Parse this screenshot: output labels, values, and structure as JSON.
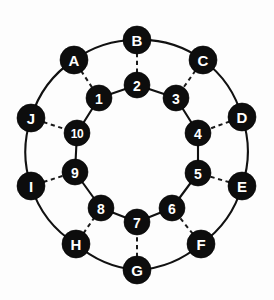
{
  "diagram": {
    "background_color": "#fdfdfd",
    "node_fill_color": "#0d0d0d",
    "node_label_color": "#ffffff",
    "edge_color": "#111111",
    "spoke_style": "dashed",
    "ring_style": "solid",
    "canvas": {
      "width": 274,
      "height": 300
    }
  },
  "outer_ring": {
    "name": "outer-cycle",
    "radius": 106,
    "center": {
      "x": 137,
      "y": 152
    },
    "node_radius": 14,
    "nodes": [
      {
        "id": "A",
        "label": "A",
        "x": 74,
        "y": 60
      },
      {
        "id": "B",
        "label": "B",
        "x": 137,
        "y": 40
      },
      {
        "id": "C",
        "label": "C",
        "x": 203,
        "y": 60
      },
      {
        "id": "D",
        "label": "D",
        "x": 242,
        "y": 117
      },
      {
        "id": "E",
        "label": "E",
        "x": 242,
        "y": 186
      },
      {
        "id": "F",
        "label": "F",
        "x": 201,
        "y": 244
      },
      {
        "id": "G",
        "label": "G",
        "x": 137,
        "y": 270
      },
      {
        "id": "H",
        "label": "H",
        "x": 76,
        "y": 244
      },
      {
        "id": "I",
        "label": "I",
        "x": 31,
        "y": 186
      },
      {
        "id": "J",
        "label": "J",
        "x": 31,
        "y": 118
      }
    ],
    "edges": [
      [
        "A",
        "B"
      ],
      [
        "B",
        "C"
      ],
      [
        "C",
        "D"
      ],
      [
        "D",
        "E"
      ],
      [
        "E",
        "F"
      ],
      [
        "F",
        "G"
      ],
      [
        "G",
        "H"
      ],
      [
        "H",
        "I"
      ],
      [
        "I",
        "J"
      ],
      [
        "J",
        "A"
      ]
    ]
  },
  "inner_ring": {
    "name": "inner-cycle",
    "radius": 63,
    "center": {
      "x": 137,
      "y": 152
    },
    "node_radius": 13,
    "nodes": [
      {
        "id": "1",
        "label": "1",
        "x": 99,
        "y": 98
      },
      {
        "id": "2",
        "label": "2",
        "x": 137,
        "y": 85
      },
      {
        "id": "3",
        "label": "3",
        "x": 176,
        "y": 98
      },
      {
        "id": "4",
        "label": "4",
        "x": 198,
        "y": 133
      },
      {
        "id": "5",
        "label": "5",
        "x": 198,
        "y": 173
      },
      {
        "id": "6",
        "label": "6",
        "x": 172,
        "y": 208
      },
      {
        "id": "7",
        "label": "7",
        "x": 137,
        "y": 222
      },
      {
        "id": "8",
        "label": "8",
        "x": 101,
        "y": 208
      },
      {
        "id": "9",
        "label": "9",
        "x": 75,
        "y": 172
      },
      {
        "id": "10",
        "label": "10",
        "x": 77,
        "y": 133
      }
    ],
    "edges": [
      [
        "1",
        "2"
      ],
      [
        "2",
        "3"
      ],
      [
        "3",
        "4"
      ],
      [
        "4",
        "5"
      ],
      [
        "5",
        "6"
      ],
      [
        "6",
        "7"
      ],
      [
        "7",
        "8"
      ],
      [
        "8",
        "9"
      ],
      [
        "9",
        "10"
      ],
      [
        "10",
        "1"
      ]
    ]
  },
  "spokes": {
    "name": "outer-inner-spokes",
    "pairs": [
      [
        "A",
        "1"
      ],
      [
        "B",
        "2"
      ],
      [
        "C",
        "3"
      ],
      [
        "D",
        "4"
      ],
      [
        "E",
        "5"
      ],
      [
        "F",
        "6"
      ],
      [
        "G",
        "7"
      ],
      [
        "H",
        "8"
      ],
      [
        "I",
        "9"
      ],
      [
        "J",
        "10"
      ]
    ]
  }
}
